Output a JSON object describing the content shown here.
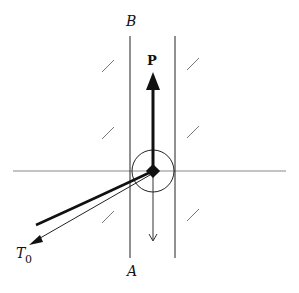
{
  "diagram": {
    "labels": {
      "top": "B",
      "bottom": "A",
      "force": "P",
      "tension": "T",
      "tension_subscript": "0"
    },
    "colors": {
      "ink": "#111111",
      "thin_line": "#555555",
      "grid_line": "#888888"
    }
  }
}
